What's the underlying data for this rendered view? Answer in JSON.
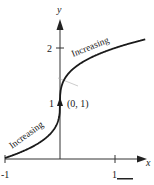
{
  "figure": {
    "type": "function-graph",
    "function_hint": "y = 1 + cube_root(x)",
    "axes": {
      "x_label": "x",
      "y_label": "y",
      "x_ticks": [
        {
          "value": -1,
          "label": "-1"
        },
        {
          "value": 1,
          "label": "1"
        }
      ],
      "y_ticks": [
        {
          "value": 1,
          "label": "1"
        },
        {
          "value": 2,
          "label": "2"
        }
      ]
    },
    "point": {
      "label": "(0, 1)",
      "x": 0,
      "y": 1
    },
    "annotations": [
      {
        "text": "Increasing",
        "region": "left"
      },
      {
        "text": "Increasing",
        "region": "right"
      }
    ],
    "colors": {
      "curve": "#1a1a1a",
      "axis": "#333333",
      "tangent": "#999999"
    }
  }
}
